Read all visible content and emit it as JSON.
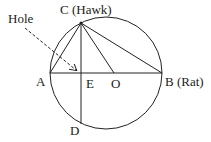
{
  "diagram": {
    "labels": {
      "C": "C (Hawk)",
      "B": "B (Rat)",
      "A": "A",
      "E": "E",
      "O": "O",
      "D": "D",
      "hole": "Hole"
    },
    "colors": {
      "stroke": "#222222",
      "background": "#ffffff"
    }
  }
}
